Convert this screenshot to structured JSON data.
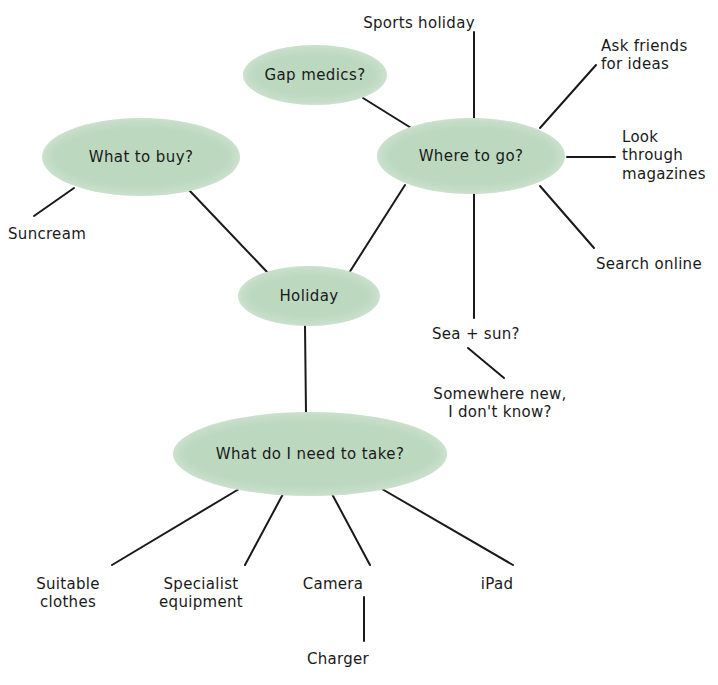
{
  "diagram": {
    "type": "mind-map",
    "background_color": "#ffffff",
    "node_fill_color": "#bcd8bf",
    "edge_color": "#1a1a1a",
    "text_color": "#1a1a1a"
  },
  "nodes": [
    {
      "id": "holiday",
      "label": "Holiday",
      "cx": 309,
      "cy": 296,
      "rx": 71,
      "ry": 30
    },
    {
      "id": "whatbuy",
      "label": "What to buy?",
      "cx": 141,
      "cy": 157,
      "rx": 99,
      "ry": 39
    },
    {
      "id": "gapmed",
      "label": "Gap medics?",
      "cx": 315,
      "cy": 75,
      "rx": 72,
      "ry": 30
    },
    {
      "id": "whereto",
      "label": "Where to go?",
      "cx": 471,
      "cy": 156,
      "rx": 94,
      "ry": 38
    },
    {
      "id": "needtake",
      "label": "What do I need to take?",
      "cx": 310,
      "cy": 454,
      "rx": 137,
      "ry": 42
    }
  ],
  "leaves": [
    {
      "id": "suncream",
      "label": "Suncream",
      "x": 8,
      "y": 225,
      "align": "left"
    },
    {
      "id": "sportsholiday",
      "label": "Sports holiday",
      "x": 419,
      "y": 14,
      "align": "center"
    },
    {
      "id": "askfriends",
      "label": "Ask friends\nfor ideas",
      "x": 601,
      "y": 37,
      "align": "left"
    },
    {
      "id": "lookthrough",
      "label": "Look through\nmagazines",
      "x": 622,
      "y": 128,
      "align": "left"
    },
    {
      "id": "searchonline",
      "label": "Search online",
      "x": 596,
      "y": 255,
      "align": "left"
    },
    {
      "id": "seasun",
      "label": "Sea + sun?",
      "x": 432,
      "y": 325,
      "align": "left"
    },
    {
      "id": "somewhere",
      "label": "Somewhere new,\nI don't know?",
      "x": 500,
      "y": 385,
      "align": "center"
    },
    {
      "id": "suitable",
      "label": "Suitable\nclothes",
      "x": 68,
      "y": 575,
      "align": "center"
    },
    {
      "id": "specialist",
      "label": "Specialist\nequipment",
      "x": 201,
      "y": 575,
      "align": "center"
    },
    {
      "id": "camera",
      "label": "Camera",
      "x": 333,
      "y": 575,
      "align": "center"
    },
    {
      "id": "charger",
      "label": "Charger",
      "x": 338,
      "y": 650,
      "align": "center"
    },
    {
      "id": "ipad",
      "label": "iPad",
      "x": 497,
      "y": 575,
      "align": "center"
    }
  ],
  "edges": [
    {
      "id": "holiday-whatbuy",
      "from": "Holiday",
      "to": "What to buy?",
      "x1": 268,
      "y1": 273,
      "x2": 189,
      "y2": 190
    },
    {
      "id": "holiday-whereto",
      "from": "Holiday",
      "to": "Where to go?",
      "x1": 349,
      "y1": 273,
      "x2": 405,
      "y2": 185
    },
    {
      "id": "holiday-needtake",
      "from": "Holiday",
      "to": "What do I need to take?",
      "x1": 305,
      "y1": 326,
      "x2": 306,
      "y2": 413
    },
    {
      "id": "gapmed-whereto",
      "from": "Gap medics?",
      "to": "Where to go?",
      "x1": 363,
      "y1": 98,
      "x2": 416,
      "y2": 131
    },
    {
      "id": "whatbuy-suncream",
      "from": "What to buy?",
      "to": "Suncream",
      "x1": 74,
      "y1": 188,
      "x2": 34,
      "y2": 216
    },
    {
      "id": "whereto-sports",
      "from": "Where to go?",
      "to": "Sports holiday",
      "x1": 474,
      "y1": 118,
      "x2": 474,
      "y2": 32
    },
    {
      "id": "whereto-askfriends",
      "from": "Where to go?",
      "to": "Ask friends for ideas",
      "x1": 540,
      "y1": 128,
      "x2": 596,
      "y2": 65
    },
    {
      "id": "whereto-magazines",
      "from": "Where to go?",
      "to": "Look through magazines",
      "x1": 567,
      "y1": 157,
      "x2": 615,
      "y2": 157
    },
    {
      "id": "whereto-search",
      "from": "Where to go?",
      "to": "Search online",
      "x1": 540,
      "y1": 186,
      "x2": 594,
      "y2": 248
    },
    {
      "id": "whereto-seasun",
      "from": "Where to go?",
      "to": "Sea + sun?",
      "x1": 474,
      "y1": 193,
      "x2": 474,
      "y2": 318
    },
    {
      "id": "seasun-somewhere",
      "from": "Sea + sun?",
      "to": "Somewhere new, I don't know?",
      "x1": 468,
      "y1": 348,
      "x2": 504,
      "y2": 378
    },
    {
      "id": "needtake-suitable",
      "from": "What do I need to take?",
      "to": "Suitable clothes",
      "x1": 239,
      "y1": 489,
      "x2": 112,
      "y2": 565
    },
    {
      "id": "needtake-specialist",
      "from": "What do I need to take?",
      "to": "Specialist equipment",
      "x1": 283,
      "y1": 494,
      "x2": 245,
      "y2": 565
    },
    {
      "id": "needtake-camera",
      "from": "What do I need to take?",
      "to": "Camera",
      "x1": 332,
      "y1": 494,
      "x2": 370,
      "y2": 565
    },
    {
      "id": "needtake-ipad",
      "from": "What do I need to take?",
      "to": "iPad",
      "x1": 382,
      "y1": 489,
      "x2": 513,
      "y2": 565
    },
    {
      "id": "camera-charger",
      "from": "Camera",
      "to": "Charger",
      "x1": 364,
      "y1": 597,
      "x2": 364,
      "y2": 641
    }
  ]
}
